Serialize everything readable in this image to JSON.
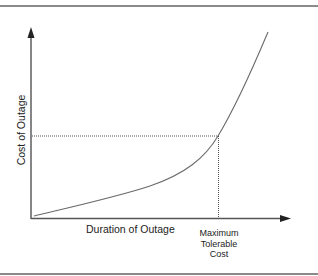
{
  "diagram": {
    "type": "cost-curve",
    "x_axis": {
      "label": "Duration of Outage"
    },
    "y_axis": {
      "label": "Cost of Outage"
    },
    "threshold": {
      "label_lines": [
        "Maximum",
        "Tolerable",
        "Cost"
      ]
    },
    "colors": {
      "frame": "#8a8a8a",
      "axis": "#444444",
      "curve": "#6a6a6a",
      "guide": "#555555",
      "text": "#222222"
    }
  }
}
